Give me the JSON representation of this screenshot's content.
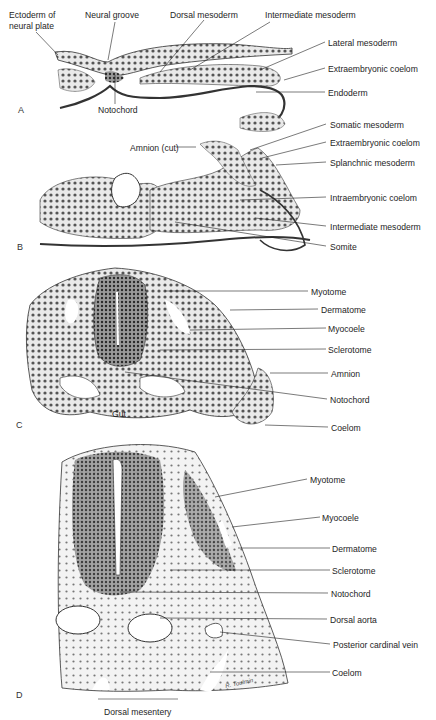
{
  "figure": {
    "panels": [
      {
        "letter": "A",
        "labels": [
          {
            "text": "Ectoderm of",
            "x": 9,
            "y": 10
          },
          {
            "text": "neural plate",
            "x": 9,
            "y": 21
          },
          {
            "text": "Neural groove",
            "x": 85,
            "y": 10
          },
          {
            "text": "Dorsal mesoderm",
            "x": 170,
            "y": 10
          },
          {
            "text": "Intermediate mesoderm",
            "x": 265,
            "y": 10
          },
          {
            "text": "Lateral mesoderm",
            "x": 328,
            "y": 38
          },
          {
            "text": "Extraembryonic coelom",
            "x": 328,
            "y": 64
          },
          {
            "text": "Endoderm",
            "x": 328,
            "y": 88
          },
          {
            "text": "Notochord",
            "x": 98,
            "y": 105
          }
        ]
      },
      {
        "letter": "B",
        "labels": [
          {
            "text": "Somatic mesoderm",
            "x": 330,
            "y": 120
          },
          {
            "text": "Amnion (cut)",
            "x": 130,
            "y": 143
          },
          {
            "text": "Extraembryonic coelom",
            "x": 330,
            "y": 138
          },
          {
            "text": "Splanchnic mesoderm",
            "x": 330,
            "y": 158
          },
          {
            "text": "Intraembryonic coelom",
            "x": 330,
            "y": 193
          },
          {
            "text": "Intermediate mesoderm",
            "x": 330,
            "y": 222
          },
          {
            "text": "Somite",
            "x": 330,
            "y": 242
          }
        ]
      },
      {
        "letter": "C",
        "labels": [
          {
            "text": "Myotome",
            "x": 311,
            "y": 287
          },
          {
            "text": "Dermatome",
            "x": 321,
            "y": 305
          },
          {
            "text": "Myocoele",
            "x": 328,
            "y": 324
          },
          {
            "text": "Sclerotome",
            "x": 328,
            "y": 345
          },
          {
            "text": "Amnion",
            "x": 331,
            "y": 369
          },
          {
            "text": "Notochord",
            "x": 330,
            "y": 395
          },
          {
            "text": "Gut",
            "x": 112,
            "y": 409
          },
          {
            "text": "Coelom",
            "x": 331,
            "y": 423
          }
        ]
      },
      {
        "letter": "D",
        "labels": [
          {
            "text": "Myotome",
            "x": 310,
            "y": 475
          },
          {
            "text": "Myocoele",
            "x": 322,
            "y": 513
          },
          {
            "text": "Dermatome",
            "x": 332,
            "y": 544
          },
          {
            "text": "Sclerotome",
            "x": 332,
            "y": 566
          },
          {
            "text": "Notochord",
            "x": 331,
            "y": 589
          },
          {
            "text": "Dorsal aorta",
            "x": 330,
            "y": 615
          },
          {
            "text": "Posterior cardinal vein",
            "x": 333,
            "y": 640
          },
          {
            "text": "Coelom",
            "x": 332,
            "y": 668
          },
          {
            "text": "Dorsal mesentery",
            "x": 104,
            "y": 707
          }
        ]
      }
    ],
    "letters": [
      {
        "text": "A",
        "x": 18,
        "y": 105
      },
      {
        "text": "B",
        "x": 17,
        "y": 242
      },
      {
        "text": "C",
        "x": 16,
        "y": 420
      },
      {
        "text": "D",
        "x": 16,
        "y": 690
      }
    ],
    "signature": "R. Toulmin"
  }
}
